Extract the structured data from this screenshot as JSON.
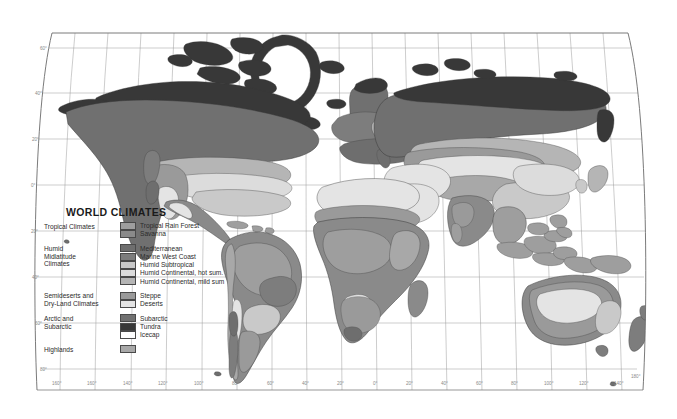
{
  "map": {
    "title": "WORLD CLIMATES",
    "projection": "robinson",
    "background_color": "#ffffff",
    "frame_color": "#6b6b6b",
    "graticule_color": "#9a9a9a",
    "coast_color": "#3a3a3a"
  },
  "legend": {
    "title": "WORLD CLIMATES",
    "groups": [
      {
        "category": [
          "Tropical Climates"
        ],
        "entries": [
          {
            "label": "Tropical Rain Forest",
            "color": "#9e9e9e"
          },
          {
            "label": "Savanna",
            "color": "#8a8a8a"
          }
        ]
      },
      {
        "category": [
          "Humid",
          "Midlatitude",
          "Climates"
        ],
        "entries": [
          {
            "label": "Mediterranean",
            "color": "#6e6e6e"
          },
          {
            "label": "Marine West Coast",
            "color": "#7d7d7d"
          },
          {
            "label": "Humid Subtropical",
            "color": "#c9c9c9"
          },
          {
            "label": "Humid Continental, hot sum.",
            "color": "#dcdcdc"
          },
          {
            "label": "Humid Continental, mild sum",
            "color": "#b5b5b5"
          }
        ]
      },
      {
        "category": [
          "Semideserts and",
          "Dry-Land Climates"
        ],
        "entries": [
          {
            "label": "Steppe",
            "color": "#9a9a9a"
          },
          {
            "label": "Deserts",
            "color": "#e4e4e4"
          }
        ]
      },
      {
        "category": [
          "Arctic and",
          "Subarctic"
        ],
        "entries": [
          {
            "label": "Subarctic",
            "color": "#707070"
          },
          {
            "label": "Tundra",
            "color": "#383838"
          },
          {
            "label": "Icecap",
            "color": "#ffffff"
          }
        ]
      },
      {
        "category": [
          "Highlands"
        ],
        "entries": [
          {
            "label": "",
            "color": "#a8a8a8"
          }
        ]
      }
    ]
  },
  "axes": {
    "longitude_labels": [
      "160°",
      "140°",
      "120°",
      "100°",
      "80°",
      "60°",
      "40°",
      "20°",
      "0°",
      "20°",
      "40°",
      "60°",
      "80°",
      "100°",
      "120°",
      "140°",
      "160°",
      "180°"
    ],
    "latitude_labels_left": [
      "60°",
      "40°",
      "20°",
      "0°",
      "20°",
      "40°",
      "60°",
      "80°"
    ],
    "latitude_labels_right": [
      "180°"
    ]
  }
}
